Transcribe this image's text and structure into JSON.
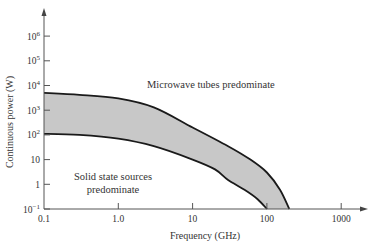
{
  "chart_data": {
    "type": "area",
    "title": "",
    "xlabel": "Frequency (GHz)",
    "ylabel": "Continuous power (W)",
    "xscale": "log",
    "yscale": "log",
    "xlim": [
      0.1,
      1000
    ],
    "ylim": [
      0.1,
      1000000
    ],
    "grid": false,
    "legend": null,
    "x_ticks": [
      {
        "value": 0.1,
        "label": "0.1"
      },
      {
        "value": 1,
        "label": "1.0"
      },
      {
        "value": 10,
        "label": "10"
      },
      {
        "value": 100,
        "label": "100"
      },
      {
        "value": 1000,
        "label": "1000"
      }
    ],
    "y_ticks": [
      {
        "value": 0.1,
        "base": "10",
        "exp": "−1"
      },
      {
        "value": 1,
        "base": "1",
        "exp": ""
      },
      {
        "value": 10,
        "base": "10",
        "exp": ""
      },
      {
        "value": 100,
        "base": "10",
        "exp": "2"
      },
      {
        "value": 1000,
        "base": "10",
        "exp": "3"
      },
      {
        "value": 10000,
        "base": "10",
        "exp": "4"
      },
      {
        "value": 100000,
        "base": "10",
        "exp": "5"
      },
      {
        "value": 1000000,
        "base": "10",
        "exp": "6"
      }
    ],
    "series": [
      {
        "name": "Upper boundary (microwave tubes limit)",
        "x": [
          0.1,
          0.3,
          1,
          3,
          10,
          30,
          60,
          100,
          150,
          200
        ],
        "y": [
          5000,
          4200,
          3000,
          1300,
          200,
          35,
          10,
          3,
          0.6,
          0.1
        ]
      },
      {
        "name": "Lower boundary (solid state limit)",
        "x": [
          0.1,
          0.3,
          1,
          3,
          10,
          20,
          30,
          50,
          75,
          100
        ],
        "y": [
          110,
          100,
          70,
          35,
          10,
          4,
          1.5,
          0.6,
          0.25,
          0.1
        ]
      }
    ],
    "shaded_region": {
      "between": [
        0,
        1
      ],
      "color": "#c8c8c8",
      "meaning": "overlap region"
    },
    "annotations": [
      {
        "text": "Microwave tubes predominate",
        "x": 30,
        "y": 3000
      },
      {
        "text": "Solid state sources",
        "x": 0.8,
        "y": 3
      },
      {
        "text": "predominate",
        "x": 0.8,
        "y": 1.2
      }
    ]
  },
  "labels": {
    "xlabel": "Frequency (GHz)",
    "ylabel": "Continuous power (W)",
    "tubes": "Microwave tubes predominate",
    "solid_line1": "Solid state sources",
    "solid_line2": "predominate"
  },
  "colors": {
    "fill": "#c8c8c8",
    "line": "#1a1a1a",
    "axis": "#555555"
  }
}
